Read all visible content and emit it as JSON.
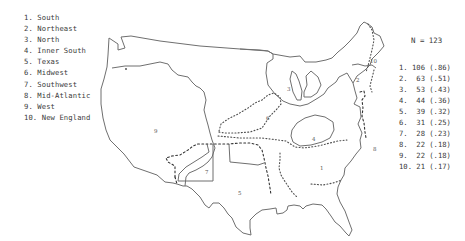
{
  "legend": {
    "items": [
      "1. South",
      "2. Northeast",
      "3. North",
      "4. Inner South",
      "5. Texas",
      "6. Midwest",
      "7. Southwest",
      "8. Mid-Atlantic",
      "9. West",
      "10. New England"
    ]
  },
  "summary": {
    "n_label": "N = 123",
    "rows": [
      "1. 106 (.86)",
      "2.  63 (.51)",
      "3.  53 (.43)",
      "4.  44 (.36)",
      "5.  39 (.32)",
      "6.  31 (.25)",
      "7.  28 (.23)",
      "8.  22 (.18)",
      "9.  22 (.18)",
      "10. 21 (.17)"
    ]
  },
  "map": {
    "region_labels": [
      {
        "id": "1",
        "x": 320,
        "y": 168
      },
      {
        "id": "2",
        "x": 357,
        "y": 80
      },
      {
        "id": "3",
        "x": 287,
        "y": 89
      },
      {
        "id": "4",
        "x": 312,
        "y": 139
      },
      {
        "id": "5",
        "x": 238,
        "y": 193
      },
      {
        "id": "6",
        "x": 266,
        "y": 118
      },
      {
        "id": "7",
        "x": 205,
        "y": 172
      },
      {
        "id": "8",
        "x": 373,
        "y": 149
      },
      {
        "id": "9",
        "x": 155,
        "y": 130
      },
      {
        "id": "10",
        "x": 371,
        "y": 61
      }
    ]
  }
}
